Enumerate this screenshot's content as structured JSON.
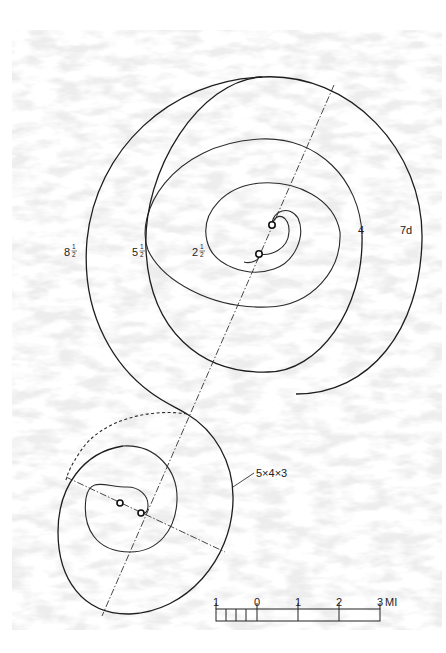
{
  "diagram": {
    "upper_spiral_labels": [
      {
        "id": "label-2-half",
        "whole": "2",
        "num": "1",
        "den": "2"
      },
      {
        "id": "label-4",
        "whole": "4"
      },
      {
        "id": "label-5-half",
        "whole": "5",
        "num": "1",
        "den": "2"
      },
      {
        "id": "label-7d",
        "whole": "7d"
      },
      {
        "id": "label-8-half",
        "whole": "8",
        "num": "1",
        "den": "2"
      }
    ],
    "lower_spiral_label": "5×4×3",
    "scale_bar": {
      "ticks": [
        "1",
        "0",
        "1",
        "2",
        "3"
      ],
      "unit": "MI"
    },
    "colors": {
      "ink": "#222222",
      "paper": "#ffffff",
      "texture": "#d9d9d9"
    }
  }
}
